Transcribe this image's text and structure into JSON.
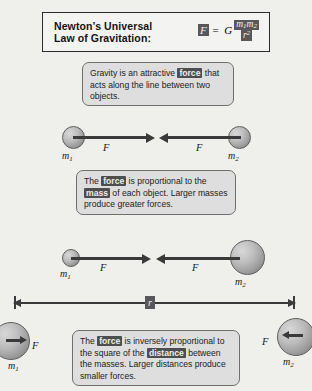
{
  "header": {
    "title": "Newton’s Universal\nLaw of Gravitation:",
    "formula": {
      "force_symbol": "F",
      "equals": "=",
      "constant": "G",
      "numerator_m1": "m",
      "numerator_m1_sub": "1",
      "numerator_m2": "m",
      "numerator_m2_sub": "2",
      "denominator": "r",
      "denominator_sup": "2"
    }
  },
  "statements": {
    "attraction": {
      "part1": "Gravity is an attractive ",
      "term": "force",
      "part2": " that acts along the line between two objects."
    },
    "mass": {
      "part1": "The ",
      "term1": "force",
      "part2": " is proportional to the ",
      "term2": "mass",
      "part3": " of each object. Larger masses produce greater forces."
    },
    "distance": {
      "part1": "The ",
      "term1": "force",
      "part2": " is inversely proportional to the square of the ",
      "term2": "distance",
      "part3": " between the masses. Larger distances produce smaller forces."
    }
  },
  "diagram_equal": {
    "mass1_label": "m",
    "mass1_sub": "1",
    "mass2_label": "m",
    "mass2_sub": "2",
    "force_left_label": "F",
    "force_right_label": "F"
  },
  "diagram_unequal": {
    "mass1_label": "m",
    "mass1_sub": "1",
    "mass2_label": "m",
    "mass2_sub": "2",
    "force_left_label": "F",
    "force_right_label": "F"
  },
  "diagram_distance": {
    "distance_label": "r",
    "mass1_label": "m",
    "mass1_sub": "1",
    "mass2_label": "m",
    "mass2_sub": "2",
    "force_left_label": "F",
    "force_right_label": "F"
  },
  "colors": {
    "page_background": "#efefec",
    "box_fill": "#dedede",
    "box_border": "#6f6f6f",
    "highlight_bg": "#4e4e50",
    "highlight_text": "#ededed",
    "ink": "#1b1b1b",
    "sphere_dark": "#6e6e6e",
    "sphere_light": "#d8d8d8"
  }
}
